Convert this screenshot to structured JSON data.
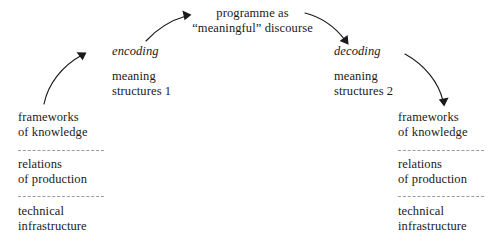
{
  "diagram": {
    "background_color": "#ffffff",
    "text_color": "#1a1a1a",
    "dash_color": "#9b9b9b",
    "top_node": {
      "line1": "programme as",
      "line2": "“meaningful” discourse"
    },
    "encoding": {
      "label": "encoding",
      "structures_line1": "meaning",
      "structures_line2": "structures 1"
    },
    "decoding": {
      "label": "decoding",
      "structures_line1": "meaning",
      "structures_line2": "structures 2"
    },
    "left_column": {
      "blocks": [
        {
          "line1": "frameworks",
          "line2": "of knowledge"
        },
        {
          "line1": "relations",
          "line2": "of production"
        },
        {
          "line1": "technical",
          "line2": "infrastructure"
        }
      ]
    },
    "right_column": {
      "blocks": [
        {
          "line1": "frameworks",
          "line2": "of knowledge"
        },
        {
          "line1": "relations",
          "line2": "of production"
        },
        {
          "line1": "technical",
          "line2": "infrastructure"
        }
      ]
    },
    "arrows": [
      {
        "name": "frameworks-to-encoding",
        "direction": "up-right"
      },
      {
        "name": "encoding-to-programme",
        "direction": "up-right"
      },
      {
        "name": "programme-to-decoding",
        "direction": "down-right"
      },
      {
        "name": "decoding-to-frameworks",
        "direction": "down-right"
      }
    ]
  }
}
